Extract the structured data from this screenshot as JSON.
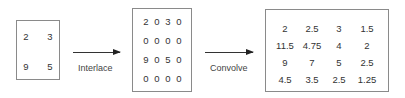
{
  "matrices": {
    "input": [
      [
        "2",
        "3"
      ],
      [
        "9",
        "5"
      ]
    ],
    "interlaced": [
      [
        "2",
        "0",
        "3",
        "0"
      ],
      [
        "0",
        "0",
        "0",
        "0"
      ],
      [
        "9",
        "0",
        "5",
        "0"
      ],
      [
        "0",
        "0",
        "0",
        "0"
      ]
    ],
    "convolved": [
      [
        "2",
        "2.5",
        "3",
        "1.5"
      ],
      [
        "11.5",
        "4.75",
        "4",
        "2"
      ],
      [
        "9",
        "7",
        "5",
        "2.5"
      ],
      [
        "4.5",
        "3.5",
        "2.5",
        "1.25"
      ]
    ]
  },
  "steps": {
    "interlace_label": "Interlace",
    "convolve_label": "Convolve"
  }
}
